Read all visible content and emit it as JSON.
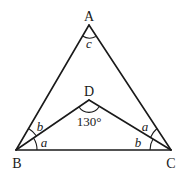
{
  "diagram": {
    "type": "geometry-triangle",
    "points": {
      "A": {
        "label": "A",
        "x": 89,
        "y": 25
      },
      "B": {
        "label": "B",
        "x": 16,
        "y": 150
      },
      "C": {
        "label": "C",
        "x": 171,
        "y": 150
      },
      "D": {
        "label": "D",
        "x": 89,
        "y": 100
      }
    },
    "segments": [
      "AB",
      "AC",
      "BC",
      "BD",
      "CD"
    ],
    "angle_labels": {
      "at_A": "c",
      "B_upper": "b",
      "B_lower": "a",
      "C_upper": "a",
      "C_lower": "b",
      "at_D": "130°"
    }
  }
}
